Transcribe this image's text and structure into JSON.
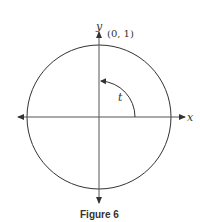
{
  "figure": {
    "caption": "Figure 6",
    "x_axis_label": "x",
    "y_axis_label": "y",
    "point_label": "(0, 1)",
    "angle_label": "t",
    "colors": {
      "stroke": "#333333",
      "background": "#ffffff"
    }
  }
}
